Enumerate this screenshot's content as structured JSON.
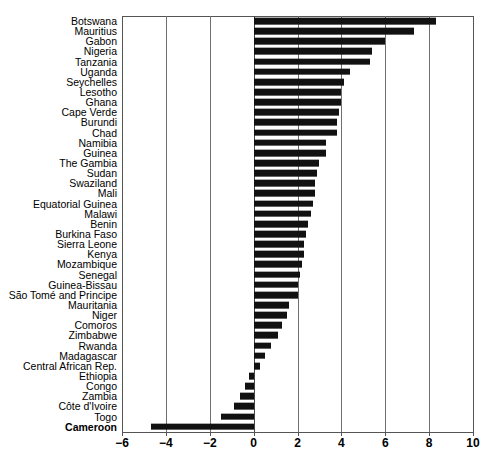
{
  "chart_data": {
    "type": "bar",
    "orientation": "horizontal",
    "title": "",
    "subtitle": "",
    "xlabel": "",
    "ylabel": "",
    "xlim": [
      -6,
      10
    ],
    "xticks": [
      -6,
      -4,
      -2,
      0,
      2,
      4,
      6,
      8,
      10
    ],
    "xtick_labels": [
      "−6",
      "−4",
      "−2",
      "0",
      "2",
      "4",
      "6",
      "8",
      "10"
    ],
    "grid": "vertical",
    "legend": "none",
    "bar_color": "#111111",
    "highlight_category": "Cameroon",
    "categories": [
      "Botswana",
      "Mauritius",
      "Gabon",
      "Nigeria",
      "Tanzania",
      "Uganda",
      "Seychelles",
      "Lesotho",
      "Ghana",
      "Cape Verde",
      "Burundi",
      "Chad",
      "Namibia",
      "Guinea",
      "The Gambia",
      "Sudan",
      "Swaziland",
      "Mali",
      "Equatorial Guinea",
      "Malawi",
      "Benin",
      "Burkina Faso",
      "Sierra Leone",
      "Kenya",
      "Mozambique",
      "Senegal",
      "Guinea-Bissau",
      "São Tomé and Principe",
      "Mauritania",
      "Niger",
      "Comoros",
      "Zimbabwe",
      "Rwanda",
      "Madagascar",
      "Central African Rep.",
      "Ethiopia",
      "Congo",
      "Zambia",
      "Côte d'Ivoire",
      "Togo",
      "Cameroon"
    ],
    "values": [
      8.3,
      7.3,
      6.0,
      5.4,
      5.3,
      4.4,
      4.1,
      4.0,
      4.0,
      3.9,
      3.8,
      3.8,
      3.3,
      3.3,
      3.0,
      2.9,
      2.8,
      2.8,
      2.7,
      2.6,
      2.5,
      2.4,
      2.3,
      2.3,
      2.2,
      2.1,
      2.0,
      2.0,
      1.6,
      1.5,
      1.3,
      1.1,
      0.8,
      0.5,
      0.3,
      -0.2,
      -0.4,
      -0.6,
      -0.9,
      -1.5,
      -4.7
    ]
  }
}
